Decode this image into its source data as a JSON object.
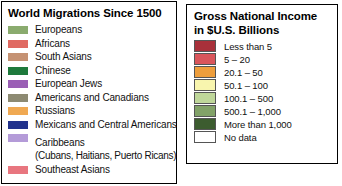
{
  "migrations_legend": {
    "title": "World Migrations Since 1500",
    "items": [
      {
        "label": "Europeans",
        "color": "#8aab6e"
      },
      {
        "label": "Africans",
        "color": "#e06a62"
      },
      {
        "label": "South Asians",
        "color": "#c59273"
      },
      {
        "label": "Chinese",
        "color": "#1e7a3c"
      },
      {
        "label": "European Jews",
        "color": "#9a5fb5"
      },
      {
        "label": "Americans and Canadians",
        "color": "#8d8a72"
      },
      {
        "label": "Russians",
        "color": "#f0a952"
      },
      {
        "label": "Mexicans and Central Americans",
        "color": "#22328c"
      },
      {
        "label": "Caribbeans",
        "sublabel": "(Cubans, Haitians, Puerto Ricans)",
        "color": "#b49bd8"
      },
      {
        "label": "Southeast Asians",
        "color": "#e8767f"
      }
    ]
  },
  "gni_legend": {
    "title_line1": "Gross National Income",
    "title_line2": "in $U.S. Billions",
    "items": [
      {
        "label": "Less than 5",
        "color": "#a8303a"
      },
      {
        "label": "5 – 20",
        "color": "#d9555b"
      },
      {
        "label": "20.1 – 50",
        "color": "#ee9e3c"
      },
      {
        "label": "50.1 – 100",
        "color": "#f8f5ae"
      },
      {
        "label": "100.1 – 500",
        "color": "#bfd79a"
      },
      {
        "label": "500.1 – 1,000",
        "color": "#82a268"
      },
      {
        "label": "More than 1,000",
        "color": "#3c5c2f"
      },
      {
        "label": "No data",
        "color": "#ffffff"
      }
    ]
  }
}
